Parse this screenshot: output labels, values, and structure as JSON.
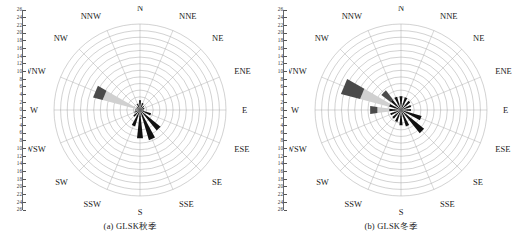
{
  "figure": {
    "background": "#ffffff",
    "panels": [
      {
        "id": "panel-a",
        "caption": "(a) GLSK秋季",
        "chart_ref": 0
      },
      {
        "id": "panel-b",
        "caption": "(b) GLSK冬季",
        "chart_ref": 1
      }
    ]
  },
  "axis": {
    "tick_labels": [
      "26",
      "24",
      "22",
      "20",
      "18",
      "16",
      "14",
      "12",
      "10",
      "8",
      "6",
      "4",
      "2",
      "0",
      "2",
      "4",
      "6",
      "8",
      "10",
      "12",
      "14",
      "16",
      "18",
      "20",
      "22",
      "24",
      "26"
    ],
    "max": 26,
    "step": 2
  },
  "colors": {
    "grid": "#9a9a9a",
    "spoke": "#a8a8a8",
    "petal_dark": "#111111",
    "petal_midgray": "#4a4a4a",
    "petal_lightgray": "#d0d0d0",
    "text": "#222222",
    "background": "#ffffff"
  },
  "compass": {
    "labels": [
      "N",
      "NNE",
      "NE",
      "ENE",
      "E",
      "ESE",
      "SE",
      "SSE",
      "S",
      "SSW",
      "SW",
      "WSW",
      "W",
      "WNW",
      "NW",
      "NNW"
    ]
  },
  "chart_data": [
    {
      "type": "windrose",
      "title": "(a) GLSK秋季",
      "xlabel": "",
      "ylabel": "",
      "rlim": [
        0,
        26
      ],
      "rticks": [
        0,
        2,
        4,
        6,
        8,
        10,
        12,
        14,
        16,
        18,
        20,
        22,
        24,
        26
      ],
      "grid": true,
      "legend": "none",
      "directions": [
        "N",
        "NNE",
        "NE",
        "ENE",
        "E",
        "ESE",
        "SE",
        "SSE",
        "S",
        "SSW",
        "SW",
        "WSW",
        "W",
        "WNW",
        "NW",
        "NNW"
      ],
      "series": [
        {
          "name": "dark (calm / low speed)",
          "color": "#111111",
          "values": [
            3.0,
            2.2,
            1.6,
            1.4,
            1.2,
            3.5,
            8.0,
            9.5,
            8.6,
            5.2,
            2.6,
            1.8,
            1.5,
            1.2,
            1.4,
            2.0
          ]
        },
        {
          "name": "light gray (mid speed)",
          "color": "#d0d0d0",
          "values": [
            0,
            0,
            0,
            0,
            0,
            0,
            0,
            0,
            0,
            0,
            0,
            0,
            0,
            10.5,
            0,
            0
          ]
        },
        {
          "name": "mid gray (high speed tip)",
          "color": "#4a4a4a",
          "values": [
            0,
            0,
            0,
            0,
            0,
            0,
            0,
            0,
            0,
            0,
            0,
            0,
            0,
            3.0,
            0,
            0
          ]
        }
      ],
      "notes": "Dominant petals point S / SSE / SE; a long light-gray WNW petal with dark-gray tip reaches ~13.5 units."
    },
    {
      "type": "windrose",
      "title": "(b) GLSK冬季",
      "xlabel": "",
      "ylabel": "",
      "rlim": [
        0,
        26
      ],
      "rticks": [
        0,
        2,
        4,
        6,
        8,
        10,
        12,
        14,
        16,
        18,
        20,
        22,
        24,
        26
      ],
      "grid": true,
      "legend": "none",
      "directions": [
        "N",
        "NNE",
        "NE",
        "ENE",
        "E",
        "ESE",
        "SE",
        "SSE",
        "S",
        "SSW",
        "SW",
        "WSW",
        "W",
        "WNW",
        "NW",
        "NNW"
      ],
      "series": [
        {
          "name": "dark (calm / low speed)",
          "color": "#111111",
          "values": [
            4.2,
            4.0,
            3.6,
            3.2,
            3.0,
            6.5,
            9.0,
            5.2,
            4.6,
            3.8,
            3.4,
            3.4,
            3.6,
            3.8,
            4.0,
            4.2
          ]
        },
        {
          "name": "light gray (mid speed)",
          "color": "#d0d0d0",
          "values": [
            0,
            0,
            0,
            0,
            0,
            0,
            0,
            0,
            0,
            0,
            0,
            0,
            3.6,
            9.0,
            0,
            0
          ]
        },
        {
          "name": "mid gray (high speed tip)",
          "color": "#4a4a4a",
          "values": [
            0,
            0,
            0,
            0,
            0,
            0,
            0,
            0,
            0,
            0,
            0,
            0,
            2.2,
            6.0,
            3.5,
            0
          ]
        }
      ],
      "notes": "Near-uniform dark inner star; strong WNW light-gray band with a long dark-gray outer block reaching ~15 units; secondary dark-gray blocks on W and NW; dominant dark ESE/SE petal ~9."
    }
  ]
}
